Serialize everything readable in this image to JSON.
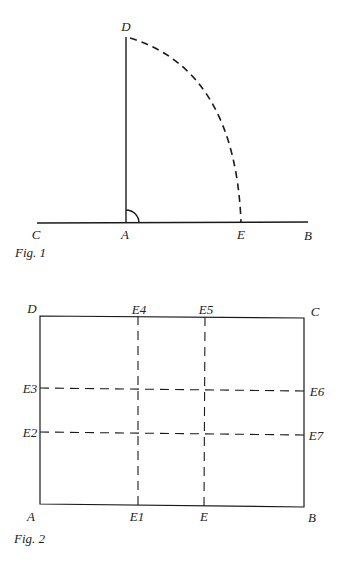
{
  "figure1": {
    "caption": "Fig. 1",
    "labels": {
      "D": "D",
      "C": "C",
      "A": "A",
      "E": "E",
      "B": "B"
    },
    "description": "Perpendicular AD erected at A on line CB with right-angle mark; dashed quarter arc from D to E"
  },
  "figure2": {
    "caption": "Fig. 2",
    "labels": {
      "D": "D",
      "E4": "E4",
      "E5": "E5",
      "C": "C",
      "E3": "E3",
      "E6": "E6",
      "E2": "E2",
      "E7": "E7",
      "A": "A",
      "E1": "E1",
      "E": "E",
      "B": "B"
    },
    "description": "Rectangle ABCD with dashed lines E1-E4, E-E5, E3-E6, E2-E7"
  },
  "colors": {
    "line": "#1a1a1a",
    "background": "#ffffff"
  }
}
